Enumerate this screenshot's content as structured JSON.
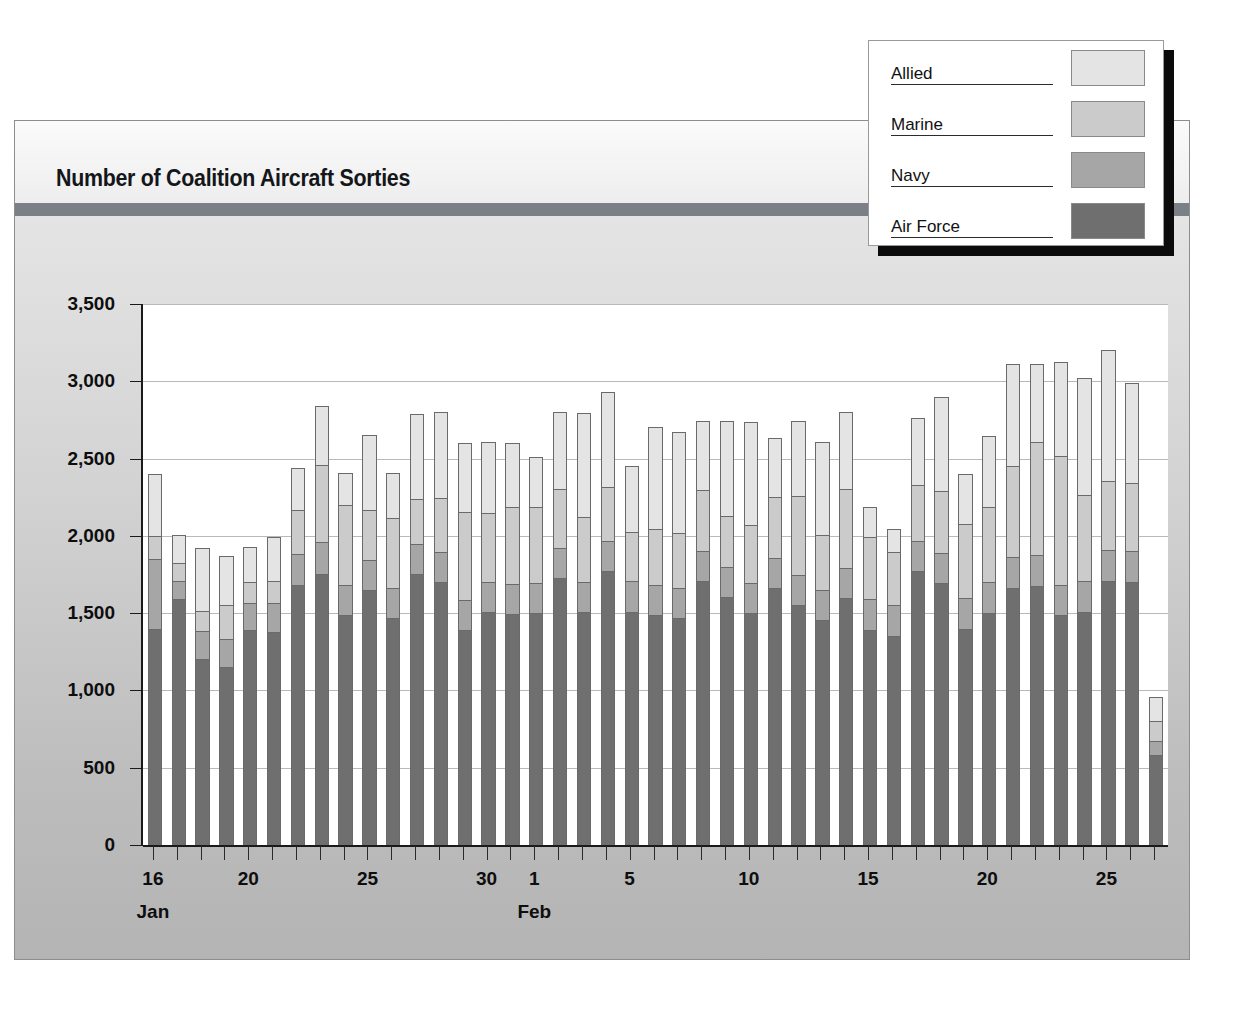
{
  "card": {
    "title": "Number of Coalition Aircraft Sorties"
  },
  "legend": {
    "entries": [
      {
        "label": "Allied",
        "color": "#e4e4e4"
      },
      {
        "label": "Marine",
        "color": "#cbcbcb"
      },
      {
        "label": "Navy",
        "color": "#a6a6a6"
      },
      {
        "label": "Air Force",
        "color": "#6f6f6f"
      }
    ]
  },
  "chart_data": {
    "type": "bar",
    "title": "Number of Coalition Aircraft Sorties",
    "subtype": "stacked-vertical",
    "xlabel": "",
    "ylabel": "",
    "ylim": [
      0,
      3500
    ],
    "ytick_labels": [
      "0",
      "500",
      "1,000",
      "1,500",
      "2,000",
      "2,500",
      "3,000",
      "3,500"
    ],
    "ytick_values": [
      0,
      500,
      1000,
      1500,
      2000,
      2500,
      3000,
      3500
    ],
    "grid": true,
    "legend_position": "top-right",
    "x_month_labels": [
      {
        "label": "Jan",
        "index": 0
      },
      {
        "label": "Feb",
        "index": 16
      }
    ],
    "x_tick_labels": [
      {
        "label": "16",
        "index": 0
      },
      {
        "label": "20",
        "index": 4
      },
      {
        "label": "25",
        "index": 9
      },
      {
        "label": "30",
        "index": 14
      },
      {
        "label": "1",
        "index": 16
      },
      {
        "label": "5",
        "index": 20
      },
      {
        "label": "10",
        "index": 25
      },
      {
        "label": "15",
        "index": 30
      },
      {
        "label": "20",
        "index": 35
      },
      {
        "label": "25",
        "index": 40
      }
    ],
    "categories": [
      "Jan 16",
      "Jan 17",
      "Jan 18",
      "Jan 19",
      "Jan 20",
      "Jan 21",
      "Jan 22",
      "Jan 23",
      "Jan 24",
      "Jan 25",
      "Jan 26",
      "Jan 27",
      "Jan 28",
      "Jan 29",
      "Jan 30",
      "Jan 31",
      "Feb 1",
      "Feb 2",
      "Feb 3",
      "Feb 4",
      "Feb 5",
      "Feb 6",
      "Feb 7",
      "Feb 8",
      "Feb 9",
      "Feb 10",
      "Feb 11",
      "Feb 12",
      "Feb 13",
      "Feb 14",
      "Feb 15",
      "Feb 16",
      "Feb 17",
      "Feb 18",
      "Feb 19",
      "Feb 20",
      "Feb 21",
      "Feb 22",
      "Feb 23",
      "Feb 24",
      "Feb 25",
      "Feb 26",
      "Feb 27"
    ],
    "series": [
      {
        "name": "Air Force",
        "color": "#6f6f6f",
        "values": [
          1400,
          1590,
          1205,
          1150,
          1390,
          1375,
          1680,
          1755,
          1490,
          1650,
          1470,
          1755,
          1700,
          1390,
          1505,
          1495,
          1500,
          1730,
          1505,
          1775,
          1510,
          1485,
          1470,
          1705,
          1605,
          1500,
          1665,
          1550,
          1455,
          1600,
          1390,
          1350,
          1770,
          1695,
          1400,
          1500,
          1665,
          1675,
          1490,
          1510,
          1710,
          1700,
          580
        ]
      },
      {
        "name": "Navy",
        "color": "#a6a6a6",
        "values": [
          450,
          120,
          180,
          185,
          175,
          190,
          200,
          205,
          190,
          195,
          195,
          195,
          195,
          195,
          195,
          195,
          195,
          190,
          195,
          195,
          195,
          195,
          195,
          195,
          195,
          195,
          195,
          195,
          195,
          195,
          200,
          200,
          195,
          195,
          195,
          200,
          200,
          200,
          195,
          200,
          200,
          200,
          90
        ]
      },
      {
        "name": "Marine",
        "color": "#cbcbcb",
        "values": [
          150,
          115,
          130,
          215,
          135,
          140,
          290,
          500,
          520,
          320,
          450,
          290,
          350,
          570,
          450,
          500,
          495,
          385,
          425,
          345,
          320,
          365,
          355,
          395,
          330,
          375,
          390,
          510,
          355,
          510,
          405,
          345,
          365,
          400,
          485,
          490,
          590,
          730,
          835,
          555,
          445,
          445,
          130
        ]
      },
      {
        "name": "Allied",
        "color": "#e4e4e4",
        "values": [
          400,
          180,
          405,
          320,
          230,
          285,
          270,
          380,
          210,
          485,
          290,
          550,
          555,
          445,
          455,
          410,
          320,
          495,
          670,
          615,
          425,
          660,
          655,
          450,
          615,
          665,
          385,
          490,
          605,
          495,
          195,
          150,
          435,
          610,
          320,
          455,
          660,
          505,
          605,
          755,
          850,
          645,
          155
        ]
      }
    ]
  }
}
